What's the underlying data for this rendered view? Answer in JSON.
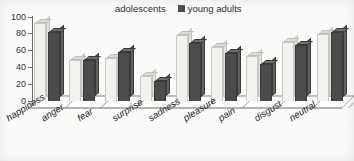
{
  "legend": {
    "position": "top-center",
    "entries": [
      {
        "label": "adolescents",
        "swatch": "light-square-icon",
        "color": "#f2f2ef"
      },
      {
        "label": "young adults",
        "swatch": "dark-square-icon",
        "color": "#4b4b4b"
      }
    ]
  },
  "axis": {
    "y_ticks": [
      "0",
      "20",
      "40",
      "60",
      "80",
      "100"
    ],
    "x_labels": [
      "happiness",
      "anger",
      "fear",
      "surprise",
      "sadness",
      "pleasure",
      "pain",
      "disgust",
      "neutral"
    ]
  },
  "chart_data": {
    "type": "bar",
    "title": "",
    "xlabel": "",
    "ylabel": "",
    "ylim": [
      0,
      100
    ],
    "ytick_step": 20,
    "grid": false,
    "legend_position": "top-center",
    "style": "3d-clustered-column",
    "categories": [
      "happiness",
      "anger",
      "fear",
      "surprise",
      "sadness",
      "pleasure",
      "pain",
      "disgust",
      "neutral"
    ],
    "series": [
      {
        "name": "adolescents",
        "color": "#f2f2ef",
        "values": [
          92,
          48,
          51,
          29,
          78,
          64,
          53,
          70,
          79
        ]
      },
      {
        "name": "young adults",
        "color": "#4b4b4b",
        "values": [
          82,
          48,
          58,
          23,
          69,
          56,
          43,
          66,
          82
        ]
      }
    ]
  }
}
